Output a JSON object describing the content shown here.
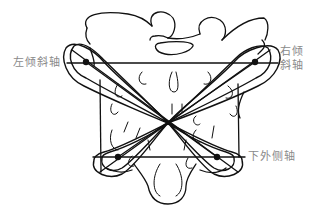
{
  "figure": {
    "type": "anatomical line diagram",
    "stroke_color": "#111111",
    "label_color": "#8a8a8a",
    "background": "#ffffff"
  },
  "labels": {
    "left_oblique_axis": "左倾斜轴",
    "right_oblique_axis_line1": "右倾",
    "right_oblique_axis_line2": "斜轴",
    "inferior_lateral_axis": "下外侧轴"
  },
  "points": {
    "left_superior": [
      86,
      62
    ],
    "right_superior": [
      255,
      62
    ],
    "center": [
      168,
      123
    ],
    "left_inferior": [
      118,
      157
    ],
    "right_inferior": [
      217,
      157
    ]
  }
}
